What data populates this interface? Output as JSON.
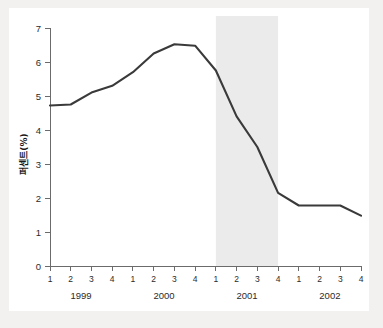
{
  "chart_data": {
    "type": "line",
    "title": "",
    "subtitle": "",
    "xlabel": "",
    "ylabel": "퍼센트(%)",
    "ylim": [
      0,
      7
    ],
    "yticks": [
      0,
      1,
      2,
      3,
      4,
      5,
      6,
      7
    ],
    "ytick_labels": [
      "0",
      "1",
      "2",
      "3",
      "4",
      "5",
      "6",
      "7"
    ],
    "grid": false,
    "legend": null,
    "legend_position": "none",
    "categories": [
      "1999 1",
      "1999 2",
      "1999 3",
      "1999 4",
      "2000 1",
      "2000 2",
      "2000 3",
      "2000 4",
      "2001 1",
      "2001 2",
      "2001 3",
      "2001 4",
      "2002 1",
      "2002 2",
      "2002 3",
      "2002 4"
    ],
    "quarter_labels": [
      "1",
      "2",
      "3",
      "4",
      "1",
      "2",
      "3",
      "4",
      "1",
      "2",
      "3",
      "4",
      "1",
      "2",
      "3",
      "4"
    ],
    "year_groups": [
      {
        "label": "1999",
        "start_index": 0,
        "end_index": 3
      },
      {
        "label": "2000",
        "start_index": 4,
        "end_index": 7
      },
      {
        "label": "2001",
        "start_index": 8,
        "end_index": 11
      },
      {
        "label": "2002",
        "start_index": 12,
        "end_index": 15
      }
    ],
    "values": [
      4.72,
      4.75,
      5.1,
      5.3,
      5.7,
      6.25,
      6.52,
      6.48,
      5.75,
      4.4,
      3.5,
      2.15,
      1.78,
      1.78,
      1.78,
      1.48
    ],
    "annotations": [
      {
        "type": "shaded-band",
        "label": "2001",
        "start_index": 8,
        "end_index": 11,
        "color": "#ebebeb"
      }
    ],
    "series_color": "#3a3a3a",
    "axis_color": "#6b6b6b",
    "background_color": "#ffffff",
    "figure_background_color": "#f2f1ef"
  }
}
